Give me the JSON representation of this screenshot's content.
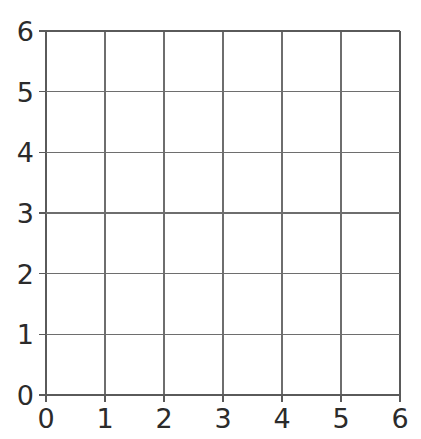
{
  "figure": {
    "background_color": "#ffffff",
    "title_fragment": "—",
    "axis_color": "#5a5a5a",
    "grid_color": "#6e6e6e",
    "label_color": "#2b2b2b"
  },
  "chart_data": {
    "type": "line",
    "title": "",
    "xlabel": "",
    "ylabel": "",
    "xlim": [
      0,
      6
    ],
    "ylim": [
      0,
      6
    ],
    "grid": true,
    "legend": "none",
    "x_ticks": [
      0,
      1,
      2,
      3,
      4,
      5,
      6
    ],
    "y_ticks": [
      0,
      1,
      2,
      3,
      4,
      5,
      6
    ],
    "x_tick_labels": [
      "0",
      "1",
      "2",
      "3",
      "4",
      "5",
      "6"
    ],
    "y_tick_labels": [
      "0",
      "1",
      "2",
      "3",
      "4",
      "5",
      "6"
    ],
    "series": [],
    "values": [],
    "categories": [],
    "annotations": [],
    "note": "Empty 6 by 6 coordinate grid with no plotted data"
  },
  "plot_area": {
    "left_px": 46,
    "right_px": 400,
    "top_px": 31,
    "bottom_px": 395
  }
}
